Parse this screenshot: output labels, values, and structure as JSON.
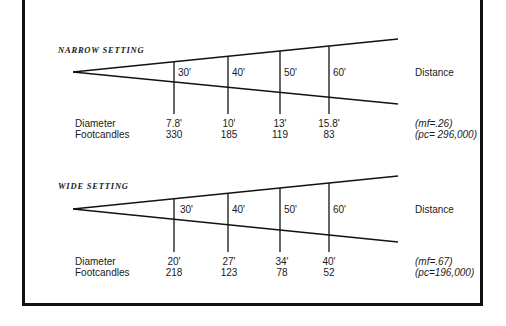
{
  "panels": [
    {
      "title": "NARROW SETTING",
      "distance_label": "Distance",
      "distances": [
        "30'",
        "40'",
        "50'",
        "60'"
      ],
      "row_labels": {
        "diameter": "Diameter",
        "footcandles": "Footcandles"
      },
      "diameters": [
        "7.8'",
        "10'",
        "13'",
        "15.8'"
      ],
      "footcandles": [
        "330",
        "185",
        "119",
        "83"
      ],
      "mf": "(mf=.26)",
      "pc": "(pc= 296,000)"
    },
    {
      "title": "WIDE SETTING",
      "distance_label": "Distance",
      "distances": [
        "30'",
        "40'",
        "50'",
        "60'"
      ],
      "row_labels": {
        "diameter": "Diameter",
        "footcandles": "Footcandles"
      },
      "diameters": [
        "20'",
        "27'",
        "34'",
        "40'"
      ],
      "footcandles": [
        "218",
        "123",
        "78",
        "52"
      ],
      "mf": "(mf=.67)",
      "pc": "(pc=196,000)"
    }
  ]
}
